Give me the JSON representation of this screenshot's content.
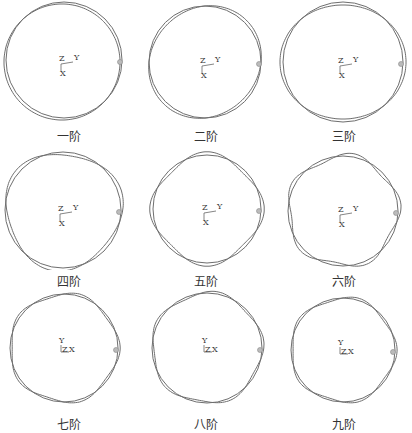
{
  "figure": {
    "line_color": "#6e6e6e",
    "modes": [
      {
        "label": "一阶",
        "order": 1,
        "axes": {
          "a": "Z",
          "b": "Y",
          "c": "X"
        },
        "triad": "ZY-X"
      },
      {
        "label": "二阶",
        "order": 2,
        "axes": {
          "a": "Z",
          "b": "Y",
          "c": "X"
        },
        "triad": "ZY-X"
      },
      {
        "label": "三阶",
        "order": 3,
        "axes": {
          "a": "Z",
          "b": "Y",
          "c": "X"
        },
        "triad": "ZY-X"
      },
      {
        "label": "四阶",
        "order": 4,
        "axes": {
          "a": "Z",
          "b": "Y",
          "c": "X"
        },
        "triad": "ZY-X"
      },
      {
        "label": "五阶",
        "order": 5,
        "axes": {
          "a": "Z",
          "b": "Y",
          "c": "X"
        },
        "triad": "ZY-X"
      },
      {
        "label": "六阶",
        "order": 6,
        "axes": {
          "a": "Z",
          "b": "Y",
          "c": "X"
        },
        "triad": "ZY-X"
      },
      {
        "label": "七阶",
        "order": 7,
        "axes": {
          "a": "Y",
          "b": "Z",
          "c": "X"
        },
        "triad": "Y-ZX"
      },
      {
        "label": "八阶",
        "order": 8,
        "axes": {
          "a": "Y",
          "b": "Z",
          "c": "X"
        },
        "triad": "Y-ZX"
      },
      {
        "label": "九阶",
        "order": 9,
        "axes": {
          "a": "Y",
          "b": "Z",
          "c": "X"
        },
        "triad": "Y-ZX"
      }
    ]
  }
}
